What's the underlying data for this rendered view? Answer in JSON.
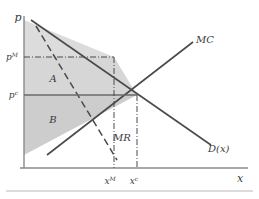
{
  "figure": {
    "kind": "economics-diagram",
    "topic": "monopoly-welfare",
    "axes": {
      "y_label": "p",
      "x_label": "x"
    },
    "curves": [
      {
        "id": "mc",
        "label": "MC",
        "style": "solid",
        "color": "#4a4a4a"
      },
      {
        "id": "demand",
        "label": "D(x)",
        "style": "solid",
        "color": "#4a4a4a"
      },
      {
        "id": "mr",
        "label": "MR",
        "style": "dashed",
        "color": "#4a4a4a"
      }
    ],
    "ticks": {
      "y": [
        {
          "id": "p_monopoly",
          "base": "p",
          "sup": "M"
        },
        {
          "id": "p_competitive",
          "base": "p",
          "sup": "c"
        }
      ],
      "x": [
        {
          "id": "x_monopoly",
          "base": "x",
          "sup": "M"
        },
        {
          "id": "x_competitive",
          "base": "x",
          "sup": "c"
        }
      ]
    },
    "regions": [
      {
        "id": "region-a",
        "label": "A",
        "fill": "#d6d6d6"
      },
      {
        "id": "region-b",
        "label": "B",
        "fill": "#cfcfcf"
      }
    ],
    "colors": {
      "line": "#4a4a4a",
      "axis": "#8a8a8a",
      "shade_light": "#dcdcdc",
      "shade_mid": "#d2d2d2",
      "shade_dark": "#c8c8c8",
      "text": "#3b3b3b",
      "frame": "#b9b9b9"
    }
  }
}
